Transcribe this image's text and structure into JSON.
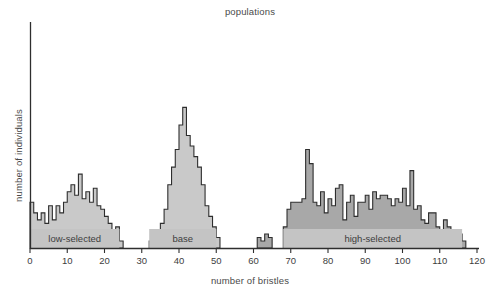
{
  "chart_data": {
    "type": "bar",
    "title": "populations",
    "xlabel": "number of bristles",
    "ylabel": "number of individuals",
    "grid": false,
    "legend_position": "none",
    "xlim": [
      0,
      120
    ],
    "ylim": [
      0,
      62
    ],
    "xticks": [
      0,
      10,
      20,
      30,
      40,
      50,
      60,
      70,
      80,
      90,
      100,
      110,
      120
    ],
    "xtick_labels": [
      "0",
      "10",
      "20",
      "30",
      "40",
      "50",
      "60",
      "70",
      "80",
      "90",
      "100",
      "110",
      "120"
    ],
    "yticks": [],
    "ytick_labels": [],
    "bin_width": 1,
    "annotations": [
      {
        "label": "low-selected",
        "x_start": 0,
        "x_end": 24,
        "center": 12
      },
      {
        "label": "base",
        "x_start": 32,
        "x_end": 50,
        "center": 41
      },
      {
        "label": "high-selected",
        "x_start": 68,
        "x_end": 116,
        "center": 92
      }
    ],
    "series": [
      {
        "name": "low-selected",
        "color": "#c9c9c9",
        "edge_color": "#2e2e2e",
        "x": [
          0,
          1,
          2,
          3,
          4,
          5,
          6,
          7,
          8,
          9,
          10,
          11,
          12,
          13,
          14,
          15,
          16,
          17,
          18,
          19,
          20,
          21,
          22,
          23,
          24
        ],
        "values": [
          13,
          10,
          8,
          10,
          7,
          12,
          8,
          12,
          10,
          13,
          16,
          18,
          15,
          21,
          14,
          16,
          13,
          17,
          12,
          11,
          9,
          7,
          5,
          6,
          2
        ]
      },
      {
        "name": "base",
        "color": "#c9c9c9",
        "edge_color": "#2e2e2e",
        "x": [
          32,
          33,
          34,
          35,
          36,
          37,
          38,
          39,
          40,
          41,
          42,
          43,
          44,
          45,
          46,
          47,
          48,
          49,
          50
        ],
        "values": [
          2,
          3,
          5,
          7,
          11,
          18,
          23,
          28,
          35,
          40,
          32,
          29,
          26,
          23,
          18,
          12,
          9,
          6,
          3
        ]
      },
      {
        "name": "high-selected-outlier",
        "color": "#a8a8a8",
        "edge_color": "#2e2e2e",
        "x": [
          61,
          62,
          63,
          64
        ],
        "values": [
          3,
          2,
          4,
          3
        ]
      },
      {
        "name": "high-selected",
        "color": "#a8a8a8",
        "edge_color": "#2e2e2e",
        "x": [
          68,
          69,
          70,
          71,
          72,
          73,
          74,
          75,
          76,
          77,
          78,
          79,
          80,
          81,
          82,
          83,
          84,
          85,
          86,
          87,
          88,
          89,
          90,
          91,
          92,
          93,
          94,
          95,
          96,
          97,
          98,
          99,
          100,
          101,
          102,
          103,
          104,
          105,
          106,
          107,
          108,
          109,
          110,
          111,
          112,
          113,
          114,
          115,
          116
        ],
        "values": [
          6,
          11,
          13,
          13,
          13,
          14,
          28,
          24,
          13,
          12,
          16,
          10,
          14,
          12,
          17,
          18,
          8,
          13,
          15,
          9,
          13,
          13,
          15,
          11,
          16,
          14,
          15,
          15,
          14,
          12,
          14,
          13,
          17,
          12,
          22,
          11,
          12,
          8,
          7,
          10,
          10,
          6,
          5,
          8,
          6,
          4,
          3,
          4,
          2
        ]
      }
    ]
  },
  "axes": {
    "y_axis_name": "y-axis-line",
    "x_axis_name": "x-axis-line"
  }
}
